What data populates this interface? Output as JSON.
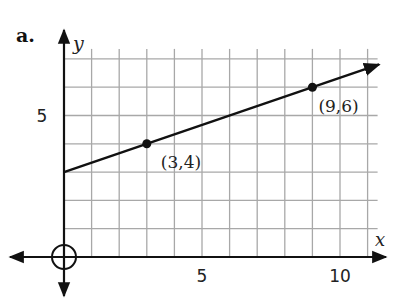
{
  "chart_data": {
    "type": "line",
    "part_label": "a.",
    "title": "",
    "xlabel": "x",
    "ylabel": "y",
    "xlim": [
      0,
      11
    ],
    "ylim": [
      0,
      7
    ],
    "grid": true,
    "x_ticks": [
      {
        "value": 5,
        "label": "5"
      },
      {
        "value": 10,
        "label": "10"
      }
    ],
    "y_ticks": [
      {
        "value": 5,
        "label": "5"
      }
    ],
    "line": {
      "slope": 0.3333,
      "intercept": 3,
      "x_start": 0,
      "x_end": 11.2
    },
    "points": [
      {
        "x": 3,
        "y": 4,
        "label": "(3,4)"
      },
      {
        "x": 9,
        "y": 6,
        "label": "(9,6)"
      }
    ],
    "origin_marker": "circle",
    "colors": {
      "grid": "#a8a8a8",
      "axis": "#111111",
      "line": "#111111"
    }
  }
}
